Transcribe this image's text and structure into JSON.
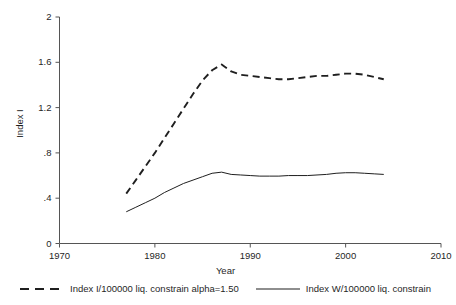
{
  "chart_data": {
    "type": "line",
    "title": "",
    "xlabel": "Year",
    "ylabel": "Index I",
    "xlim": [
      1970,
      2010
    ],
    "ylim": [
      0,
      2
    ],
    "grid": false,
    "legend_position": "bottom",
    "xticks": [
      1970,
      1980,
      1990,
      2000,
      2010
    ],
    "xtick_labels": [
      "1970",
      "1980",
      "1990",
      "2000",
      "2010"
    ],
    "yticks": [
      0,
      0.4,
      0.8,
      1.2,
      1.6,
      2
    ],
    "ytick_labels": [
      "0",
      ".4",
      ".8",
      "1.2",
      "1.6",
      "2"
    ],
    "series": [
      {
        "name": "Index I/100000 liq. constrain alpha=1.50",
        "style": "dashed",
        "color": "#1f1f1f",
        "x": [
          1977,
          1978,
          1979,
          1980,
          1981,
          1982,
          1983,
          1984,
          1985,
          1986,
          1987,
          1988,
          1989,
          1990,
          1991,
          1992,
          1993,
          1994,
          1995,
          1996,
          1997,
          1998,
          1999,
          2000,
          2001,
          2002,
          2003,
          2004
        ],
        "values": [
          0.44,
          0.56,
          0.68,
          0.8,
          0.93,
          1.06,
          1.19,
          1.32,
          1.44,
          1.53,
          1.58,
          1.52,
          1.49,
          1.48,
          1.47,
          1.46,
          1.45,
          1.45,
          1.46,
          1.47,
          1.48,
          1.48,
          1.49,
          1.5,
          1.5,
          1.49,
          1.47,
          1.45
        ]
      },
      {
        "name": "Index W/100000 liq. constrain",
        "style": "solid",
        "color": "#1f1f1f",
        "x": [
          1977,
          1978,
          1979,
          1980,
          1981,
          1982,
          1983,
          1984,
          1985,
          1986,
          1987,
          1988,
          1989,
          1990,
          1991,
          1992,
          1993,
          1994,
          1995,
          1996,
          1997,
          1998,
          1999,
          2000,
          2001,
          2002,
          2003,
          2004
        ],
        "values": [
          0.28,
          0.32,
          0.36,
          0.4,
          0.45,
          0.49,
          0.53,
          0.56,
          0.59,
          0.62,
          0.63,
          0.61,
          0.605,
          0.6,
          0.595,
          0.595,
          0.595,
          0.6,
          0.6,
          0.6,
          0.605,
          0.61,
          0.62,
          0.625,
          0.625,
          0.62,
          0.615,
          0.61
        ]
      }
    ]
  },
  "axes": {
    "ylabel": "Index I",
    "xlabel": "Year"
  },
  "legend": {
    "items": [
      {
        "label": "Index I/100000 liq. constrain alpha=1.50",
        "style": "dashed"
      },
      {
        "label": "Index W/100000 liq. constrain",
        "style": "solid"
      }
    ]
  },
  "colors": {
    "line": "#1f1f1f",
    "axis": "#555555",
    "background": "#ffffff"
  }
}
